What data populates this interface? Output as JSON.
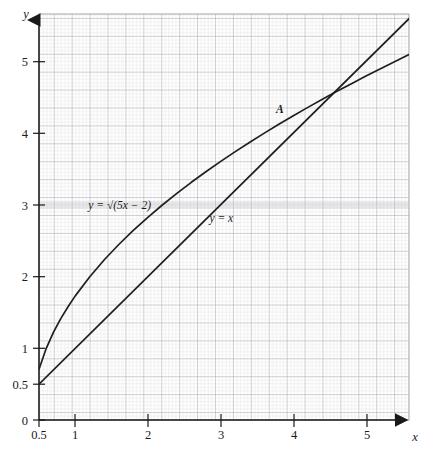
{
  "chart_data": {
    "type": "line",
    "title": "",
    "subtitle": "",
    "xlabel": "x",
    "ylabel": "y",
    "xlim": [
      0.5,
      5.6
    ],
    "ylim": [
      0,
      5.6
    ],
    "xticks": [
      "0.5",
      "1",
      "2",
      "3",
      "4",
      "5"
    ],
    "xtick_values": [
      0.5,
      1,
      2,
      3,
      4,
      5
    ],
    "yticks": [
      "0",
      "0.5",
      "1",
      "2",
      "3",
      "4",
      "5"
    ],
    "ytick_values": [
      0,
      0.5,
      1,
      2,
      3,
      4,
      5
    ],
    "grid": "fine graph paper, minor squares every 0.05 units, major lines every 0.25 units",
    "grid_minor_color": "#c9c9cf",
    "grid_major_color": "#9b9ba3",
    "axis_color": "#1a1a1a",
    "curve_color": "#1f1f1f",
    "legend": "inline curve labels",
    "series": [
      {
        "name": "y = √(5x − 2)",
        "label": "y = √(5x − 2)",
        "label_x": 1.18,
        "label_y": 3.0,
        "expression": "sqrt(5*x - 2)",
        "x": [
          0.5,
          0.6,
          0.7,
          0.8,
          0.9,
          1.0,
          1.2,
          1.4,
          1.6,
          1.8,
          2.0,
          2.2,
          2.4,
          2.6,
          2.8,
          3.0,
          3.2,
          3.4,
          3.6,
          3.8,
          4.0,
          4.2,
          4.4,
          4.6,
          4.8,
          5.0,
          5.2,
          5.4,
          5.6
        ],
        "y": [
          0.707,
          1.0,
          1.225,
          1.414,
          1.581,
          1.732,
          2.0,
          2.236,
          2.449,
          2.646,
          2.828,
          3.0,
          3.162,
          3.317,
          3.464,
          3.606,
          3.742,
          3.873,
          4.0,
          4.123,
          4.243,
          4.359,
          4.472,
          4.583,
          4.69,
          4.796,
          4.899,
          5.0,
          5.099
        ]
      },
      {
        "name": "y = x",
        "label": "y = x",
        "label_x": 2.85,
        "label_y": 2.82,
        "expression": "x",
        "x": [
          0.5,
          5.6
        ],
        "y": [
          0.5,
          5.6
        ]
      }
    ],
    "annotations": [
      {
        "label": "A",
        "description": "intersection point of y = √(5x − 2) and y = x",
        "x": 4.0,
        "y": 4.0,
        "label_offset_x": -0.18,
        "label_offset_y": 0.28
      }
    ]
  },
  "axes": {
    "x_axis_name": "x",
    "y_axis_name": "y"
  }
}
